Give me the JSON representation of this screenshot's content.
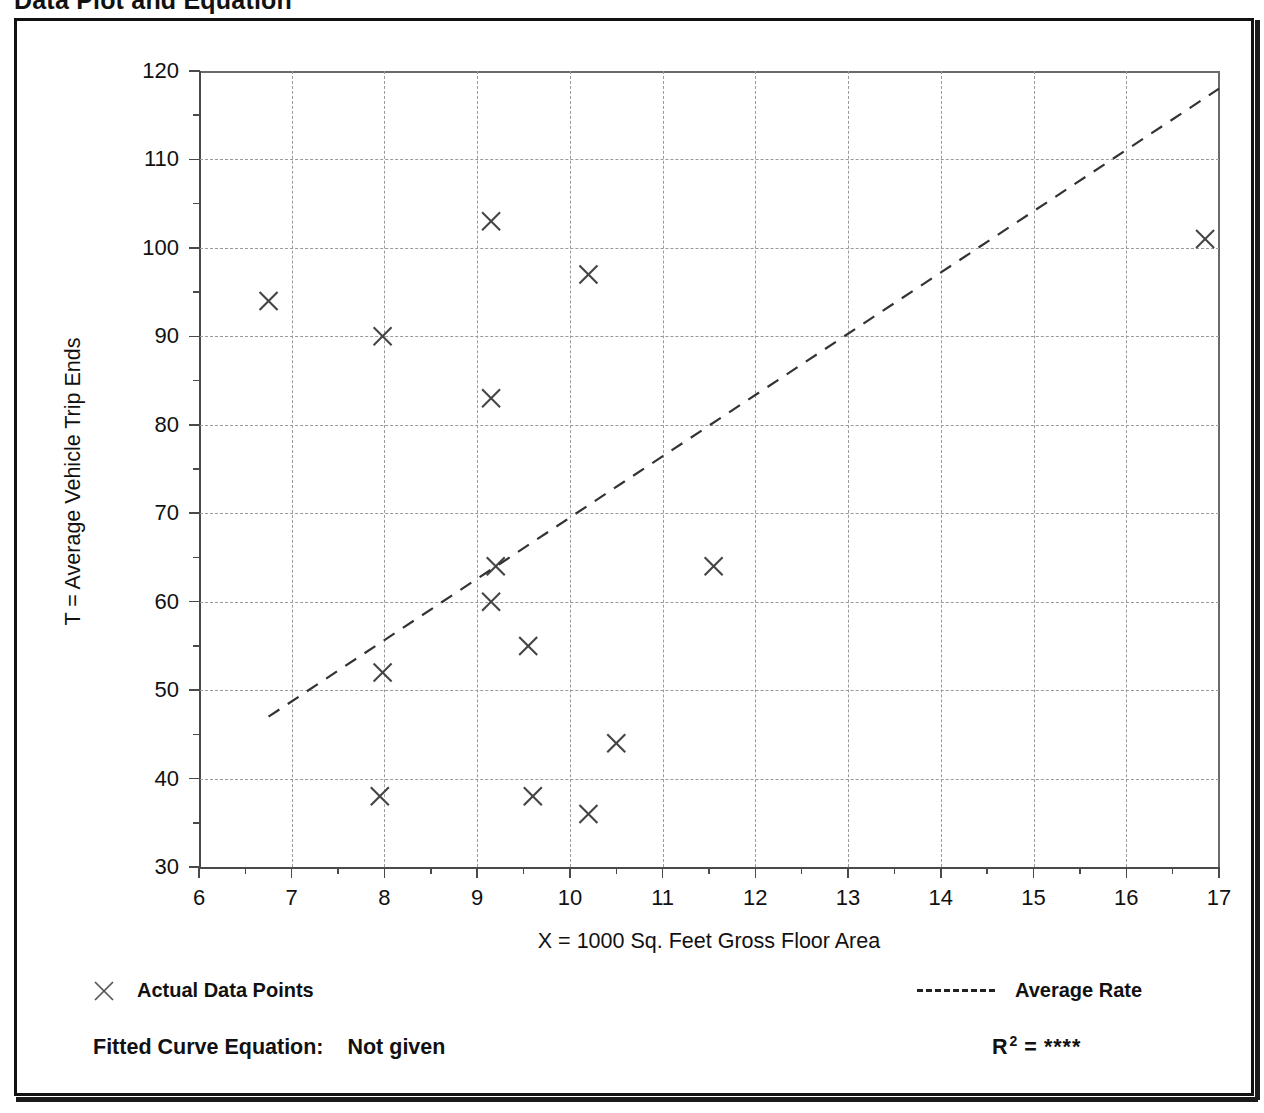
{
  "page": {
    "title": "Data Plot and Equation"
  },
  "axes": {
    "x_title": "X = 1000 Sq. Feet Gross Floor Area",
    "y_title": "T = Average Vehicle Trip Ends",
    "x_ticks": [
      "6",
      "7",
      "8",
      "9",
      "10",
      "11",
      "12",
      "13",
      "14",
      "15",
      "16",
      "17"
    ],
    "y_ticks": [
      "30",
      "40",
      "50",
      "60",
      "70",
      "80",
      "90",
      "100",
      "110",
      "120"
    ]
  },
  "legend": {
    "points_marker": "x-cross-marker",
    "points_label": "Actual Data Points",
    "line_marker": "dashed-line",
    "line_label": "Average Rate"
  },
  "footer": {
    "equation_label": "Fitted Curve Equation:",
    "equation_value": "Not given",
    "r2_symbol": "R",
    "r2_exponent": "2",
    "r2_equals": "=",
    "r2_value": "****"
  },
  "chart_data": {
    "type": "scatter",
    "title": "Data Plot and Equation",
    "xlabel": "X = 1000 Sq. Feet Gross Floor Area",
    "ylabel": "T = Average Vehicle Trip Ends",
    "xlim": [
      6,
      17
    ],
    "ylim": [
      30,
      120
    ],
    "x_tick_step": 1,
    "y_tick_step": 10,
    "x_minor_tick_step": 0.5,
    "y_minor_tick_step": 5,
    "grid": true,
    "grid_style": "dotted",
    "legend_position": "below-plot",
    "series": [
      {
        "name": "Actual Data Points",
        "type": "scatter",
        "marker": "x",
        "color": "#444444",
        "points": [
          {
            "x": 6.75,
            "y": 94
          },
          {
            "x": 7.98,
            "y": 90
          },
          {
            "x": 7.98,
            "y": 52
          },
          {
            "x": 7.95,
            "y": 38
          },
          {
            "x": 9.15,
            "y": 103
          },
          {
            "x": 9.15,
            "y": 83
          },
          {
            "x": 9.2,
            "y": 64
          },
          {
            "x": 9.15,
            "y": 60
          },
          {
            "x": 9.55,
            "y": 55
          },
          {
            "x": 9.6,
            "y": 38
          },
          {
            "x": 10.2,
            "y": 97
          },
          {
            "x": 10.2,
            "y": 36
          },
          {
            "x": 10.5,
            "y": 44
          },
          {
            "x": 11.55,
            "y": 64
          },
          {
            "x": 16.85,
            "y": 101
          }
        ]
      },
      {
        "name": "Average Rate",
        "type": "line",
        "style": "dashed",
        "color": "#333333",
        "x": [
          6.75,
          17.0
        ],
        "y": [
          47,
          118
        ]
      }
    ]
  }
}
